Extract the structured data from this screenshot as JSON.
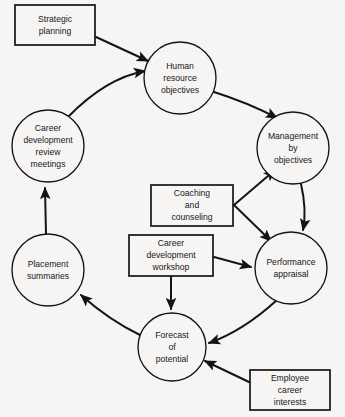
{
  "diagram": {
    "background_color": "#f6f5f3",
    "stroke_color": "#141418",
    "nodes": [
      {
        "id": "strategic-planning",
        "shape": "rectangle",
        "label": "Strategic\nplanning",
        "lines": [
          "Strategic",
          "planning"
        ],
        "x": 55,
        "y": 25,
        "w": 80,
        "h": 40
      },
      {
        "id": "human-resource-objectives",
        "shape": "circle",
        "label": "Human\nresource\nobjectives",
        "lines": [
          "Human",
          "resource",
          "objectives"
        ],
        "x": 180,
        "y": 78,
        "r": 36
      },
      {
        "id": "management-by-objectives",
        "shape": "circle",
        "label": "Management\nby\nobjectives",
        "lines": [
          "Management",
          "by",
          "objectives"
        ],
        "x": 293,
        "y": 148,
        "r": 36
      },
      {
        "id": "career-development-review-meetings",
        "shape": "circle",
        "label": "Career\ndevelopment\nreview\nmeetings",
        "lines": [
          "Career",
          "development",
          "review",
          "meetings"
        ],
        "x": 48,
        "y": 146,
        "r": 36
      },
      {
        "id": "coaching-and-counseling",
        "shape": "rectangle",
        "label": "Coaching\nand\ncounseling",
        "lines": [
          "Coaching",
          "and",
          "counseling"
        ],
        "x": 192,
        "y": 205,
        "w": 82,
        "h": 41
      },
      {
        "id": "career-development-workshop",
        "shape": "rectangle",
        "label": "Career\ndevelopment\nworkshop",
        "lines": [
          "Career",
          "development",
          "workshop"
        ],
        "x": 171,
        "y": 255,
        "w": 84,
        "h": 41
      },
      {
        "id": "performance-appraisal",
        "shape": "circle",
        "label": "Performance\nappraisal",
        "lines": [
          "Performance",
          "appraisal"
        ],
        "x": 291,
        "y": 268,
        "r": 36
      },
      {
        "id": "placement-summaries",
        "shape": "circle",
        "label": "Placement\nsummaries",
        "lines": [
          "Placement",
          "summaries"
        ],
        "x": 48,
        "y": 270,
        "r": 36
      },
      {
        "id": "forecast-of-potential",
        "shape": "circle",
        "label": "Forecast\nof\npotential",
        "lines": [
          "Forecast",
          "of",
          "potential"
        ],
        "x": 172,
        "y": 347,
        "r": 34
      },
      {
        "id": "employee-career-interests",
        "shape": "rectangle",
        "label": "Employee\ncareer\ninterests",
        "lines": [
          "Employee",
          "career",
          "interests"
        ],
        "x": 290,
        "y": 390,
        "w": 80,
        "h": 40
      }
    ],
    "edges": [
      {
        "id": "strategic-planning-to-human-resource-objectives",
        "from": "strategic-planning",
        "to": "human-resource-objectives",
        "style": "straight",
        "arrow": "end"
      },
      {
        "id": "human-resource-objectives-to-management-by-objectives",
        "from": "human-resource-objectives",
        "to": "management-by-objectives",
        "style": "curve",
        "arrow": "end"
      },
      {
        "id": "management-by-objectives-to-performance-appraisal",
        "from": "management-by-objectives",
        "to": "performance-appraisal",
        "style": "curve",
        "arrow": "end"
      },
      {
        "id": "performance-appraisal-to-forecast-of-potential",
        "from": "performance-appraisal",
        "to": "forecast-of-potential",
        "style": "curve",
        "arrow": "end"
      },
      {
        "id": "forecast-of-potential-to-placement-summaries",
        "from": "forecast-of-potential",
        "to": "placement-summaries",
        "style": "curve",
        "arrow": "end"
      },
      {
        "id": "placement-summaries-to-career-development-review-meetings",
        "from": "placement-summaries",
        "to": "career-development-review-meetings",
        "style": "straight",
        "arrow": "end"
      },
      {
        "id": "career-development-review-meetings-to-human-resource-objectives",
        "from": "career-development-review-meetings",
        "to": "human-resource-objectives",
        "style": "curve",
        "arrow": "end"
      },
      {
        "id": "coaching-and-counseling-to-management-by-objectives",
        "from": "coaching-and-counseling",
        "to": "management-by-objectives",
        "style": "straight",
        "arrow": "end"
      },
      {
        "id": "coaching-and-counseling-to-performance-appraisal",
        "from": "coaching-and-counseling",
        "to": "performance-appraisal",
        "style": "straight",
        "arrow": "end"
      },
      {
        "id": "career-development-workshop-to-performance-appraisal",
        "from": "career-development-workshop",
        "to": "performance-appraisal",
        "style": "straight",
        "arrow": "end"
      },
      {
        "id": "career-development-workshop-to-forecast-of-potential",
        "from": "career-development-workshop",
        "to": "forecast-of-potential",
        "style": "straight",
        "arrow": "end"
      },
      {
        "id": "employee-career-interests-to-forecast-of-potential",
        "from": "employee-career-interests",
        "to": "forecast-of-potential",
        "style": "straight",
        "arrow": "end"
      }
    ]
  }
}
